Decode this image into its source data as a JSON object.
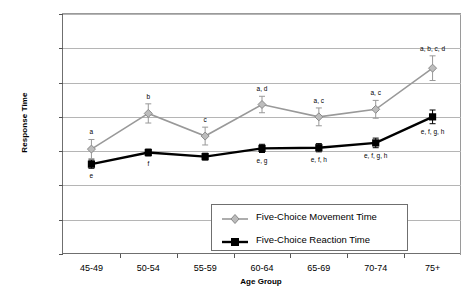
{
  "chart_data": {
    "type": "line",
    "title": "",
    "xlabel": "Age Group",
    "ylabel": "Response Time",
    "categories": [
      "45-49",
      "50-54",
      "55-59",
      "60-64",
      "65-69",
      "70-74",
      "75+"
    ],
    "ylim": [
      200,
      550
    ],
    "yticks": [
      200,
      250,
      300,
      350,
      400,
      450,
      500,
      550
    ],
    "ytick_labels": [
      "200",
      "250",
      "300",
      "350",
      "400",
      "450",
      "500",
      "550"
    ],
    "grid": true,
    "legend_position": "inside-bottom-center",
    "series": [
      {
        "name": "Five-Choice Movement Time",
        "color": "#999999",
        "marker": "diamond",
        "values": [
          353,
          405,
          372,
          418,
          400,
          411,
          471
        ],
        "errors": [
          14,
          14,
          13,
          12,
          13,
          13,
          18
        ],
        "annotations": [
          "a",
          "b",
          "c",
          "a, d",
          "a, c",
          "a, c",
          "a, b, c, d"
        ]
      },
      {
        "name": "Five-Choice Reaction Time",
        "color": "#000000",
        "marker": "square",
        "values": [
          331,
          348,
          342,
          354,
          355,
          362,
          400
        ],
        "errors": [
          6,
          5,
          5,
          6,
          6,
          7,
          10
        ],
        "annotations": [
          "e",
          "f",
          "",
          "e, g",
          "e, f, h",
          "e, f, g, h",
          "e, f, g, h"
        ]
      }
    ],
    "legend_entries": [
      "Five-Choice Movement Time",
      "Five-Choice Reaction Time"
    ]
  }
}
